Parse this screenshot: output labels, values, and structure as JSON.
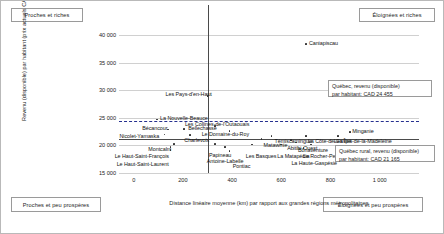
{
  "quadrants": {
    "top_left": "Proches et riches",
    "top_right": "Éloignées et riches",
    "bottom_left": "Proches et peu prospères",
    "bottom_right": "Éloignées et peu prospères"
  },
  "callouts": {
    "quebec": "Québec, revenu (disponible)\npar habitant: CAD 24 455",
    "quebec_line1": "Québec, revenu (disponible)",
    "quebec_line2": "par habitant: CAD 24 455",
    "rural_line1": "Québec rural, revenu (disponible)",
    "rural_line2": "par habitant: CAD 21 165"
  },
  "chart_data": {
    "type": "scatter",
    "title": "",
    "xlabel": "Distance linéaire moyenne (km) par rapport aux grandes régions métropolitaines",
    "ylabel": "Revenu (disponible) par habitant (prix actuels CAD)",
    "xlim": [
      -60,
      1160
    ],
    "ylim": [
      15000,
      41500
    ],
    "xticks": [
      0,
      200,
      400,
      600,
      800,
      1000
    ],
    "xticklabels": [
      "0",
      "200",
      "400",
      "600",
      "800",
      "1 000"
    ],
    "yticks": [
      15000,
      20000,
      25000,
      30000,
      35000,
      40000
    ],
    "yticklabels": [
      "15 000",
      "20 000",
      "25 000",
      "30 000",
      "35 000",
      "40 000"
    ],
    "grid": true,
    "legend": "none",
    "reference_lines": {
      "vertical_x": 300,
      "horizontal_y_solid": 21165,
      "horizontal_y_dashed": 24455
    },
    "points": [
      {
        "label": "Caniapiscau",
        "x": 700,
        "y": 38400
      },
      {
        "label": "Les Pays-d'en-Haut",
        "x": 300,
        "y": 29000
      },
      {
        "label": "La Nouvelle-Beauce",
        "x": 95,
        "y": 24700
      },
      {
        "label": "Bécancour",
        "x": 140,
        "y": 22900
      },
      {
        "label": "Bellechasse",
        "x": 205,
        "y": 22950
      },
      {
        "label": "Nicolet-Yamaska",
        "x": 125,
        "y": 22000
      },
      {
        "label": "Charlevoix",
        "x": 230,
        "y": 21900
      },
      {
        "label": "Les Collines-de-l'Outaouais",
        "x": 330,
        "y": 23500
      },
      {
        "label": "Le Domaine-du-Roy",
        "x": 390,
        "y": 22600
      },
      {
        "label": "Témiscamingue",
        "x": 560,
        "y": 21700
      },
      {
        "label": "Abitibi-Ouest",
        "x": 640,
        "y": 21050
      },
      {
        "label": "Matawinie",
        "x": 520,
        "y": 21150
      },
      {
        "label": "La Côte-de-Gaspé",
        "x": 700,
        "y": 21700
      },
      {
        "label": "Les Îles-de-la-Madeleine",
        "x": 830,
        "y": 21700
      },
      {
        "label": "Minganie",
        "x": 880,
        "y": 22400
      },
      {
        "label": "Bonaventure",
        "x": 660,
        "y": 20550
      },
      {
        "label": "La Matapédia",
        "x": 600,
        "y": 20150
      },
      {
        "label": "Le Rocher-Percé",
        "x": 720,
        "y": 20150
      },
      {
        "label": "La Haute-Gaspésie",
        "x": 690,
        "y": 19500
      },
      {
        "label": "Les Basques",
        "x": 480,
        "y": 20150
      },
      {
        "label": "Papineau",
        "x": 330,
        "y": 20250
      },
      {
        "label": "Antoine-Labelle",
        "x": 370,
        "y": 19700
      },
      {
        "label": "Montcalm",
        "x": 165,
        "y": 20250
      },
      {
        "label": "Le Haut-Saint-François",
        "x": 150,
        "y": 19700
      },
      {
        "label": "Le Haut-Saint-Laurent",
        "x": 150,
        "y": 19150
      },
      {
        "label": "Pontiac",
        "x": 390,
        "y": 18950
      }
    ]
  }
}
